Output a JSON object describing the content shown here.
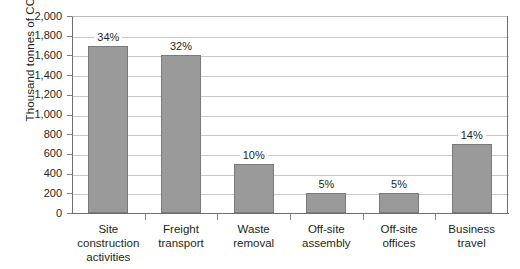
{
  "chart_data": {
    "type": "bar",
    "title": "",
    "subtitle": "",
    "xlabel": "",
    "ylabel": "Thousand tonnes of CO",
    "ylabel_subscript": "2",
    "categories": [
      "Site construction activities",
      "Freight transport",
      "Waste removal",
      "Off-site assembly",
      "Off-site offices",
      "Business travel"
    ],
    "category_lines": [
      [
        "Site",
        "construction",
        "activities"
      ],
      [
        "Freight",
        "transport"
      ],
      [
        "Waste",
        "removal"
      ],
      [
        "Off-site",
        "assembly"
      ],
      [
        "Off-site",
        "offices"
      ],
      [
        "Business",
        "travel"
      ]
    ],
    "values": [
      1700,
      1600,
      500,
      200,
      200,
      700
    ],
    "data_labels": [
      "34%",
      "32%",
      "10%",
      "5%",
      "5%",
      "14%"
    ],
    "ylim": [
      0,
      2000
    ],
    "ytick_values": [
      0,
      200,
      400,
      600,
      800,
      1000,
      1200,
      1400,
      1600,
      1800,
      2000
    ],
    "ytick_labels": [
      "0",
      "200",
      "400",
      "600",
      "800",
      "1,000",
      "1,200",
      "1,400",
      "1,600",
      "1,800",
      "2,000"
    ],
    "grid": true,
    "grid_axis": "y",
    "legend": false,
    "legend_position": "none",
    "bar_color": "#9a9a9a",
    "bar_border_color": "#7a7a7a",
    "grid_color": "#c9c9c9",
    "axis_color": "#6e6e6e",
    "text_color": "#231f20"
  }
}
